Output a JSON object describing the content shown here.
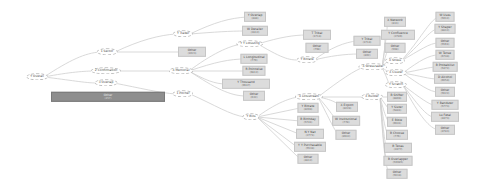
{
  "diagram": {
    "title": "",
    "root": {
      "label": "Y Overall",
      "x": 37,
      "y": 77
    },
    "split_nodes": [
      {
        "id": "n1",
        "label": "1 Sector",
        "x": 107,
        "y": 52
      },
      {
        "id": "n2",
        "label": "2 Confirmation",
        "x": 106,
        "y": 71
      },
      {
        "id": "n3",
        "label": "3 Overlap",
        "x": 106,
        "y": 83
      },
      {
        "id": "n4",
        "label": "Y Trader",
        "x": 183,
        "y": 34
      },
      {
        "id": "n5",
        "label": "X Memorial",
        "x": 181,
        "y": 71
      },
      {
        "id": "n6",
        "label": "1 Pitcher",
        "x": 183,
        "y": 94
      },
      {
        "id": "n7",
        "label": "Y Y Lotusting",
        "x": 250,
        "y": 44
      },
      {
        "id": "n8",
        "label": "Y Bios",
        "x": 251,
        "y": 117
      },
      {
        "id": "n9",
        "label": "Y Bitrate",
        "x": 307,
        "y": 60
      },
      {
        "id": "n10",
        "label": "X Lotustream",
        "x": 309,
        "y": 97
      },
      {
        "id": "n11",
        "label": "X Stressraster",
        "x": 373,
        "y": 67
      },
      {
        "id": "n12",
        "label": "X Builder",
        "x": 372,
        "y": 97
      },
      {
        "id": "n13",
        "label": "X Stress",
        "x": 395,
        "y": 61
      },
      {
        "id": "n14",
        "label": "X Cluster",
        "x": 396,
        "y": 73
      },
      {
        "id": "n15",
        "label": "Y Scratch",
        "x": 396,
        "y": 85
      }
    ],
    "leaves": [
      {
        "label": "Other",
        "count": "(457)",
        "x": 108,
        "y": 97,
        "w": 108,
        "style": "dark"
      },
      {
        "label": "Other",
        "count": "(1023)",
        "x": 192,
        "y": 52,
        "w": 22,
        "style": "light"
      },
      {
        "label": "Y Overlap",
        "count": "(884)",
        "x": 255,
        "y": 17,
        "w": 16,
        "style": "light"
      },
      {
        "label": "W Derailer",
        "count": "(2812)",
        "x": 255,
        "y": 31,
        "w": 20,
        "style": "light"
      },
      {
        "label": "L Longitudinal",
        "count": "(779)",
        "x": 254,
        "y": 59,
        "w": 17,
        "style": "light"
      },
      {
        "label": "R Pointwise",
        "count": "(9812)",
        "x": 254,
        "y": 71,
        "w": 16,
        "style": "light"
      },
      {
        "label": "Y Thousand",
        "count": "(9647)",
        "x": 246,
        "y": 84,
        "w": 42,
        "style": "light"
      },
      {
        "label": "Other",
        "count": "(632)",
        "x": 254,
        "y": 96,
        "w": 16,
        "style": "light"
      },
      {
        "label": "T Tribal",
        "count": "(1714)",
        "x": 317,
        "y": 35,
        "w": 22,
        "style": "light"
      },
      {
        "label": "Other",
        "count": "(798)",
        "x": 317,
        "y": 48,
        "w": 17,
        "style": "light"
      },
      {
        "label": "Y Tribal",
        "count": "(1714)",
        "x": 367,
        "y": 41,
        "w": 21,
        "style": "light"
      },
      {
        "label": "Other",
        "count": "(802)",
        "x": 367,
        "y": 54,
        "w": 16,
        "style": "light"
      },
      {
        "label": "X Network",
        "count": "(813)",
        "x": 395,
        "y": 22,
        "w": 16,
        "style": "light"
      },
      {
        "label": "Y Confluence",
        "count": "(2789)",
        "x": 398,
        "y": 35,
        "w": 28,
        "style": "light"
      },
      {
        "label": "Other",
        "count": "(568)",
        "x": 395,
        "y": 48,
        "w": 15,
        "style": "light"
      },
      {
        "label": "Y Bitrate",
        "count": "(8204)",
        "x": 308,
        "y": 108,
        "w": 15,
        "style": "light"
      },
      {
        "label": "B Birthday",
        "count": "(5741)",
        "x": 308,
        "y": 121,
        "w": 15,
        "style": "light"
      },
      {
        "label": "N Y Nat",
        "count": "(2771)",
        "x": 310,
        "y": 134,
        "w": 22,
        "style": "light"
      },
      {
        "label": "Y Y Purchasable",
        "count": "(5538)",
        "x": 310,
        "y": 147,
        "w": 26,
        "style": "light"
      },
      {
        "label": "Other",
        "count": "(4812)",
        "x": 308,
        "y": 159,
        "w": 15,
        "style": "light"
      },
      {
        "label": "X Export",
        "count": "(8228)",
        "x": 347,
        "y": 107,
        "w": 16,
        "style": "light"
      },
      {
        "label": "W Institutional",
        "count": "(778)",
        "x": 346,
        "y": 121,
        "w": 17,
        "style": "light"
      },
      {
        "label": "Other",
        "count": "(8942)",
        "x": 346,
        "y": 135,
        "w": 15,
        "style": "light"
      },
      {
        "label": "B Shifter",
        "count": "(8804)",
        "x": 397,
        "y": 97,
        "w": 14,
        "style": "light"
      },
      {
        "label": "Y Sister",
        "count": "(5881)",
        "x": 397,
        "y": 109,
        "w": 14,
        "style": "light"
      },
      {
        "label": "E Bible",
        "count": "(6641)",
        "x": 397,
        "y": 122,
        "w": 14,
        "style": "light"
      },
      {
        "label": "B Choose",
        "count": "(776)",
        "x": 397,
        "y": 135,
        "w": 16,
        "style": "light"
      },
      {
        "label": "B Texas",
        "count": "(2477)",
        "x": 398,
        "y": 148,
        "w": 22,
        "style": "light"
      },
      {
        "label": "B Overlapper",
        "count": "(56685)",
        "x": 398,
        "y": 161,
        "w": 23,
        "style": "light"
      },
      {
        "label": "Other",
        "count": "(5634)",
        "x": 397,
        "y": 174,
        "w": 15,
        "style": "light"
      },
      {
        "label": "W Uses",
        "count": "(5012)",
        "x": 445,
        "y": 17,
        "w": 13,
        "style": "light"
      },
      {
        "label": "Y Shaper",
        "count": "(8812)",
        "x": 445,
        "y": 29,
        "w": 15,
        "style": "light"
      },
      {
        "label": "Other",
        "count": "(5561)",
        "x": 445,
        "y": 43,
        "w": 13,
        "style": "light"
      },
      {
        "label": "W Tense",
        "count": "(6744)",
        "x": 445,
        "y": 55,
        "w": 13,
        "style": "light"
      },
      {
        "label": "B Probabilist",
        "count": "(5472)",
        "x": 445,
        "y": 67,
        "w": 17,
        "style": "light"
      },
      {
        "label": "D Alcohol",
        "count": "(6654)",
        "x": 445,
        "y": 79,
        "w": 16,
        "style": "light"
      },
      {
        "label": "Other",
        "count": "(5622)",
        "x": 445,
        "y": 92,
        "w": 14,
        "style": "light"
      },
      {
        "label": "Y Bandster",
        "count": "(5773)",
        "x": 445,
        "y": 105,
        "w": 21,
        "style": "light"
      },
      {
        "label": "Lu Fetal",
        "count": "(4473)",
        "x": 445,
        "y": 117,
        "w": 22,
        "style": "light"
      },
      {
        "label": "Other",
        "count": "(4783)",
        "x": 445,
        "y": 130,
        "w": 14,
        "style": "light"
      }
    ],
    "edges": [
      "M44 77 C 70 60, 85 53, 100 52",
      "M44 77 C 70 72, 85 71, 95 71",
      "M44 77 C 70 80, 85 83, 97 83",
      "M115 52 C 140 40, 160 35, 176 34",
      "M115 52 L 180 52",
      "M117 71 L 172 71",
      "M114 83 C 140 88, 160 93, 176 94",
      "M190 34 C 215 22, 230 18, 247 17",
      "M190 34 C 215 32, 230 31, 245 31",
      "M189 71 C 210 55, 230 45, 243 44",
      "M189 71 C 215 62, 230 59, 245 59",
      "M189 71 L 246 71",
      "M189 71 C 205 80, 215 84, 226 84",
      "M189 71 C 215 88, 230 96, 246 96",
      "M190 94 C 215 105, 230 115, 245 117",
      "M258 44 C 280 37, 295 35, 306 35",
      "M258 44 C 285 60, 290 60, 300 60",
      "M314 60 C 330 48, 345 42, 357 41",
      "M314 60 C 330 56, 345 54, 359 54",
      "M257 117 C 280 100, 295 97, 300 97",
      "M257 117 L 300 108",
      "M257 117 L 300 121",
      "M257 117 L 299 134",
      "M257 117 L 297 147",
      "M257 117 L 300 159",
      "M318 97 C 335 100, 340 105, 339 107",
      "M318 97 C 330 110, 335 120, 338 121",
      "M318 97 C 330 120, 335 132, 339 135",
      "M318 97 L 364 97",
      "M380 97 L 390 97",
      "M380 97 C 386 105, 388 109, 390 109",
      "M380 97 C 384 112, 387 122, 390 122",
      "M380 97 C 383 118, 386 135, 389 135",
      "M380 97 C 383 125, 385 148, 387 148",
      "M380 97 C 383 135, 385 160, 387 161",
      "M380 97 C 383 140, 385 170, 390 174",
      "M318 97 C 340 80, 355 70, 364 67",
      "M382 67 C 386 40, 388 25, 387 22",
      "M382 67 C 386 45, 385 37, 384 35",
      "M382 67 C 386 55, 388 49, 388 48",
      "M382 67 C 386 62, 388 61, 389 61",
      "M382 67 C 388 72, 389 73, 389 73",
      "M382 67 C 388 80, 389 84, 389 85",
      "M401 61 C 420 40, 430 20, 438 17",
      "M401 61 C 420 45, 430 30, 437 29",
      "M401 61 C 420 50, 430 43, 438 43",
      "M403 73 C 420 60, 430 55, 438 55",
      "M403 73 C 420 70, 430 67, 436 67",
      "M403 73 C 420 76, 430 79, 437 79",
      "M403 73 C 420 85, 430 92, 438 92",
      "M403 85 C 420 98, 430 105, 434 105",
      "M403 85 C 420 108, 428 117, 434 117",
      "M403 85 C 420 118, 430 128, 438 130"
    ],
    "colors": {
      "edge": "#cfcfcf",
      "leaf_light": "#dcdcdc",
      "leaf_dark": "#8e8e8e",
      "background": "#ffffff"
    }
  }
}
